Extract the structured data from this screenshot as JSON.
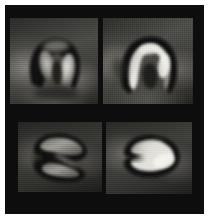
{
  "figure": {
    "title": "Cardiac myocardial perfusion montage",
    "modality": "grayscale tomographic slice",
    "grid_rows": 2,
    "grid_cols": 2,
    "background_color": "#0d0d0d",
    "page_margin_color": "#ffffff",
    "frame": {
      "x": 5,
      "y": 5,
      "width": 199,
      "height": 209
    }
  },
  "colors": {
    "frame_black": "#0d0d0d",
    "tissue_dark": "#161616",
    "tissue_mid": "#5a5a5a",
    "tissue_bright": "#d8d8d8",
    "wall_outline": "#090909",
    "highlight_peak": "#f0efec",
    "panel_floor": "#1b1b1b"
  },
  "panels": [
    {
      "id": "panel-top-left",
      "position": "top-left",
      "label": "Top left slice",
      "shape": "inverted-u horseshoe with two bright limbs",
      "brightness_level": "moderate",
      "bounds": {
        "x": 10,
        "y": 18,
        "width": 88,
        "height": 86
      }
    },
    {
      "id": "panel-top-right",
      "position": "top-right",
      "label": "Top right slice",
      "shape": "inverted-u arch with continuous bright rim",
      "brightness_level": "high",
      "bounds": {
        "x": 103,
        "y": 18,
        "width": 90,
        "height": 86
      }
    },
    {
      "id": "panel-bottom-left",
      "position": "bottom-left",
      "label": "Bottom left slice",
      "shape": "horizontal crescent with two lobes opening left",
      "brightness_level": "low",
      "bounds": {
        "x": 18,
        "y": 122,
        "width": 84,
        "height": 70
      }
    },
    {
      "id": "panel-bottom-right",
      "position": "bottom-right",
      "label": "Bottom right slice",
      "shape": "bright horizontal crescent opening left",
      "brightness_level": "high",
      "bounds": {
        "x": 106,
        "y": 122,
        "width": 86,
        "height": 72
      }
    }
  ]
}
